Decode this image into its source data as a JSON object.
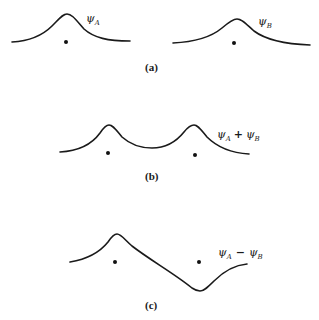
{
  "figure": {
    "panels": [
      {
        "id": "a",
        "caption": "(a)",
        "curves": [
          {
            "name": "psi-A",
            "symbol": "ψ",
            "subscript": "A",
            "label_text": "ψA"
          },
          {
            "name": "psi-B",
            "symbol": "ψ",
            "subscript": "B",
            "label_text": "ψB"
          }
        ],
        "nuclei": 2
      },
      {
        "id": "b",
        "caption": "(b)",
        "label": {
          "symbol1": "ψ",
          "sub1": "A",
          "operator": "+",
          "symbol2": "ψ",
          "sub2": "B"
        },
        "description": "symmetric combination ψA + ψB",
        "nuclei": 2
      },
      {
        "id": "c",
        "caption": "(c)",
        "label": {
          "symbol1": "ψ",
          "sub1": "A",
          "operator": "−",
          "symbol2": "ψ",
          "sub2": "B"
        },
        "description": "antisymmetric combination ψA − ψB",
        "nuclei": 2
      }
    ],
    "colors": {
      "ink": "#1a1a1a",
      "background": "#ffffff"
    }
  }
}
